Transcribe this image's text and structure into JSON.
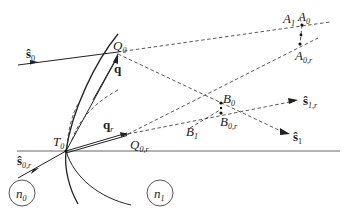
{
  "figure": {
    "media": [
      {
        "id": "n0",
        "label": "n",
        "sub": "0"
      },
      {
        "id": "n1",
        "label": "n",
        "sub": "1"
      }
    ],
    "points": {
      "Q0": {
        "label": "Q",
        "sub": "0"
      },
      "Q0r": {
        "label": "Q",
        "sub": "0,r"
      },
      "T0": {
        "label": "T",
        "sub": "0"
      },
      "A0": {
        "label": "A",
        "sub": "0"
      },
      "A0r": {
        "label": "A",
        "sub": "0,r"
      },
      "A1": {
        "label": "A",
        "sub": "1"
      },
      "B0": {
        "label": "B",
        "sub": "0"
      },
      "B0r": {
        "label": "B",
        "sub": "0,r"
      },
      "B1": {
        "label": "B",
        "sub": "1"
      }
    },
    "vectors": {
      "s0": {
        "label": "ŝ",
        "sub": "0"
      },
      "s0r": {
        "label": "ŝ",
        "sub": "0,r"
      },
      "s1": {
        "label": "ŝ",
        "sub": "1"
      },
      "s1r": {
        "label": "ŝ",
        "sub": "1,r"
      },
      "q": {
        "label": "q",
        "sub": ""
      },
      "qr": {
        "label": "q",
        "sub": "r"
      }
    }
  }
}
